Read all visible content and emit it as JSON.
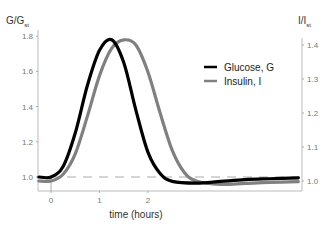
{
  "chart_data": {
    "type": "line",
    "title": "",
    "xlabel": "time (hours)",
    "ylabel_left": "G/G_st",
    "ylabel_right": "I/I_st",
    "xlim": [
      -0.25,
      5.1
    ],
    "ylim_left": [
      0.92,
      1.83
    ],
    "ylim_right": [
      0.95,
      1.43
    ],
    "x_ticks": [
      0,
      1,
      2
    ],
    "y_ticks_left": [
      1.0,
      1.2,
      1.4,
      1.6,
      1.8
    ],
    "y_ticks_right": [
      1.0,
      1.1,
      1.2,
      1.3,
      1.4
    ],
    "grid": false,
    "reference_line": {
      "style": "dashed",
      "y_left": 1.0
    },
    "legend_position": "upper right",
    "series": [
      {
        "name": "Glucose, G",
        "axis": "left",
        "color": "#000000",
        "x": [
          -0.25,
          0,
          0.25,
          0.5,
          0.75,
          1.0,
          1.25,
          1.5,
          1.75,
          2.0,
          2.25,
          2.5,
          3.0,
          3.5,
          4.0,
          4.5,
          5.1
        ],
        "values": [
          1.0,
          1.0,
          1.06,
          1.25,
          1.52,
          1.72,
          1.78,
          1.65,
          1.38,
          1.14,
          1.02,
          0.975,
          0.965,
          0.975,
          0.985,
          0.99,
          0.995
        ]
      },
      {
        "name": "Insulin, I",
        "axis": "right",
        "color": "#808080",
        "x": [
          -0.25,
          0,
          0.25,
          0.5,
          0.75,
          1.0,
          1.25,
          1.5,
          1.75,
          2.0,
          2.25,
          2.5,
          2.75,
          3.0,
          3.5,
          4.0,
          4.5,
          5.1
        ],
        "values": [
          1.0,
          1.0,
          1.02,
          1.08,
          1.19,
          1.31,
          1.39,
          1.415,
          1.4,
          1.32,
          1.2,
          1.09,
          1.025,
          1.0,
          0.99,
          0.993,
          0.996,
          0.998
        ]
      }
    ]
  },
  "labels": {
    "y_left_main": "G/G",
    "y_left_sub": "st",
    "y_right_main": "I/I",
    "y_right_sub": "st",
    "x_title": "time (hours)",
    "legend_glucose": "Glucose, G",
    "legend_insulin": "Insulin, I"
  }
}
